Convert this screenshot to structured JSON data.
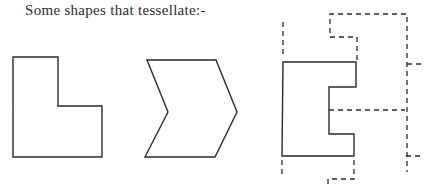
{
  "title": "Some shapes that tessellate:-",
  "colors": {
    "stroke": "#2a2a2a",
    "background": "#ffffff"
  },
  "shapes": [
    {
      "name": "l-shape",
      "style": "solid",
      "points": "13,57 58,57 58,106 102,106 102,157 13,157"
    },
    {
      "name": "chevron",
      "style": "solid",
      "points": "147,60 216,60 237,112 215,157 145,157 168,112"
    },
    {
      "name": "notched-shape",
      "style": "solid",
      "points": "283,62 356,62 356,87 329,87 329,134 354,134 354,156 282,156"
    }
  ],
  "dashed_lines": [
    {
      "name": "left-extension-top",
      "points": "283,22 283,58"
    },
    {
      "name": "left-extension-bottom",
      "points": "282,160 282,178"
    },
    {
      "name": "adjacent-tile-top",
      "points": "357,60 357,37 330,37 330,14 407,14 407,172"
    },
    {
      "name": "middle-edge",
      "points": "329,110 405,110"
    },
    {
      "name": "right-tick-top",
      "points": "407,64 423,64"
    },
    {
      "name": "right-tick-bottom",
      "points": "406,156 421,156"
    },
    {
      "name": "adjacent-tile-bottom",
      "points": "354,160 354,179 328,179 328,186"
    }
  ]
}
